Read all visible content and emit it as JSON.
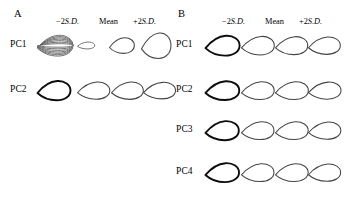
{
  "figure": {
    "background_color": "#ffffff",
    "outline_color": "#444444",
    "bold_outline_color": "#0d0d0d",
    "width_px": 338,
    "height_px": 197
  },
  "column_headers": {
    "minus_2sd": "−2S.D.",
    "mean": "Mean",
    "plus_2sd": "+2S.D."
  },
  "panels": [
    {
      "letter": "A",
      "rows": [
        {
          "label": "PC1",
          "shapes": [
            {
              "name": "superimposed-outline-fan",
              "style": "fan",
              "scale": 1.0,
              "elongation": 1.0
            },
            {
              "name": "leaf-outline-minus2sd",
              "style": "thin",
              "scale": 0.4,
              "elongation": 2.3
            },
            {
              "name": "leaf-outline-mean",
              "style": "normal",
              "scale": 0.72,
              "elongation": 1.45
            },
            {
              "name": "leaf-outline-plus2sd",
              "style": "normal",
              "scale": 1.0,
              "elongation": 1.05
            }
          ]
        },
        {
          "label": "PC2",
          "shapes": [
            {
              "name": "superimposed-outline-bold",
              "style": "bold",
              "scale": 0.92,
              "elongation": 1.55
            },
            {
              "name": "leaf-outline-minus2sd",
              "style": "normal",
              "scale": 0.86,
              "elongation": 1.7
            },
            {
              "name": "leaf-outline-mean",
              "style": "normal",
              "scale": 0.86,
              "elongation": 1.65
            },
            {
              "name": "leaf-outline-plus2sd",
              "style": "normal",
              "scale": 0.84,
              "elongation": 1.75
            }
          ]
        }
      ]
    },
    {
      "letter": "B",
      "rows": [
        {
          "label": "PC1",
          "shapes": [
            {
              "name": "superimposed-outline-bold",
              "style": "bold",
              "scale": 0.95,
              "elongation": 1.55
            },
            {
              "name": "leaf-outline-minus2sd",
              "style": "normal",
              "scale": 0.9,
              "elongation": 1.6
            },
            {
              "name": "leaf-outline-mean",
              "style": "normal",
              "scale": 0.88,
              "elongation": 1.62
            },
            {
              "name": "leaf-outline-plus2sd",
              "style": "normal",
              "scale": 0.86,
              "elongation": 1.65
            }
          ]
        },
        {
          "label": "PC2",
          "shapes": [
            {
              "name": "superimposed-outline-bold",
              "style": "bold",
              "scale": 0.92,
              "elongation": 1.62
            },
            {
              "name": "leaf-outline-minus2sd",
              "style": "normal",
              "scale": 0.88,
              "elongation": 1.66
            },
            {
              "name": "leaf-outline-mean",
              "style": "normal",
              "scale": 0.88,
              "elongation": 1.68
            },
            {
              "name": "leaf-outline-plus2sd",
              "style": "normal",
              "scale": 0.86,
              "elongation": 1.72
            }
          ]
        },
        {
          "label": "PC3",
          "shapes": [
            {
              "name": "superimposed-outline-bold",
              "style": "bold",
              "scale": 0.92,
              "elongation": 1.58
            },
            {
              "name": "leaf-outline-minus2sd",
              "style": "normal",
              "scale": 0.88,
              "elongation": 1.64
            },
            {
              "name": "leaf-outline-mean",
              "style": "normal",
              "scale": 0.88,
              "elongation": 1.66
            },
            {
              "name": "leaf-outline-plus2sd",
              "style": "normal",
              "scale": 0.86,
              "elongation": 1.7
            }
          ]
        },
        {
          "label": "PC4",
          "shapes": [
            {
              "name": "superimposed-outline-bold",
              "style": "bold",
              "scale": 0.92,
              "elongation": 1.6
            },
            {
              "name": "leaf-outline-minus2sd",
              "style": "normal",
              "scale": 0.88,
              "elongation": 1.64
            },
            {
              "name": "leaf-outline-mean",
              "style": "normal",
              "scale": 0.88,
              "elongation": 1.66
            },
            {
              "name": "leaf-outline-plus2sd",
              "style": "normal",
              "scale": 0.86,
              "elongation": 1.68
            }
          ]
        }
      ]
    }
  ],
  "layout": {
    "panel_a_row_tops": [
      28,
      73
    ],
    "panel_b_row_tops": [
      28,
      73,
      113,
      155
    ],
    "slot_lefts_panel_a": [
      0,
      40,
      72,
      104
    ],
    "slot_lefts_panel_b": [
      0,
      36,
      70,
      103
    ]
  }
}
